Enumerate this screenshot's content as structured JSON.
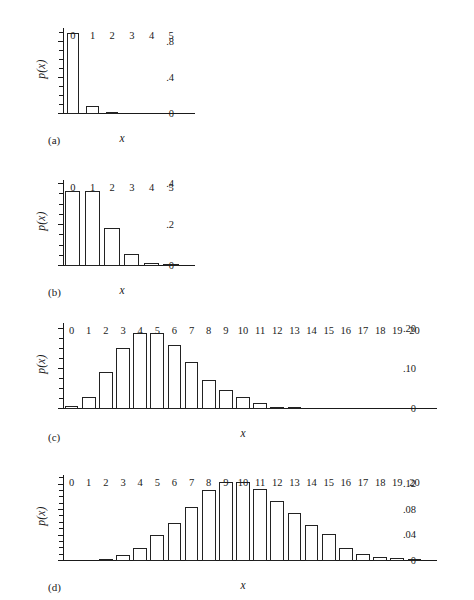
{
  "figure": {
    "background_color": "#ffffff",
    "ink_color": "#222222",
    "panels": [
      {
        "tag": "(a)",
        "tag_name": "panel-label-a",
        "xlabel": "x",
        "ylabel": "p(x)",
        "ytick_labels": [
          "0",
          ".4",
          ".8"
        ],
        "xtick_labels": [
          "0",
          "1",
          "2",
          "3",
          "4",
          "5"
        ]
      },
      {
        "tag": "(b)",
        "tag_name": "panel-label-b",
        "xlabel": "x",
        "ylabel": "p(x)",
        "ytick_labels": [
          "0",
          ".2",
          ".4"
        ],
        "xtick_labels": [
          "0",
          "1",
          "2",
          "3",
          "4",
          "5"
        ]
      },
      {
        "tag": "(c)",
        "tag_name": "panel-label-c",
        "xlabel": "x",
        "ylabel": "p(x)",
        "ytick_labels": [
          "0",
          ".10",
          ".20"
        ],
        "xtick_labels": [
          "0",
          "1",
          "2",
          "3",
          "4",
          "5",
          "6",
          "7",
          "8",
          "9",
          "10",
          "11",
          "12",
          "13",
          "14",
          "15",
          "16",
          "17",
          "18",
          "19",
          "20"
        ]
      },
      {
        "tag": "(d)",
        "tag_name": "panel-label-d",
        "xlabel": "x",
        "ylabel": "p(x)",
        "ytick_labels": [
          "0",
          ".04",
          ".08",
          ".12"
        ],
        "xtick_labels": [
          "0",
          "1",
          "2",
          "3",
          "4",
          "5",
          "6",
          "7",
          "8",
          "9",
          "10",
          "11",
          "12",
          "13",
          "14",
          "15",
          "16",
          "17",
          "18",
          "19",
          "20"
        ]
      }
    ]
  },
  "chart_data": [
    {
      "id": "a",
      "type": "bar",
      "title": "",
      "subtitle": "",
      "xlabel": "x",
      "ylabel": "p(x)",
      "categories": [
        0,
        1,
        2,
        3,
        4,
        5
      ],
      "values": [
        0.904,
        0.091,
        0.005,
        0.0,
        0.0,
        0.0
      ],
      "xlim": [
        -0.5,
        5.5
      ],
      "ylim": [
        0,
        0.96
      ],
      "ytick_values": [
        0,
        0.4,
        0.8
      ],
      "ytick_labels": [
        "0",
        ".4",
        ".8"
      ],
      "yminor_step": 0.1,
      "xtick_labels": [
        "0",
        "1",
        "2",
        "3",
        "4",
        "5"
      ],
      "grid": false,
      "legend": "none",
      "annotation": "(a)"
    },
    {
      "id": "b",
      "type": "bar",
      "title": "",
      "subtitle": "",
      "xlabel": "x",
      "ylabel": "p(x)",
      "categories": [
        0,
        1,
        2,
        3,
        4,
        5
      ],
      "values": [
        0.368,
        0.368,
        0.184,
        0.061,
        0.015,
        0.003
      ],
      "xlim": [
        -0.5,
        5.5
      ],
      "ylim": [
        0,
        0.42
      ],
      "ytick_values": [
        0,
        0.2,
        0.4
      ],
      "ytick_labels": [
        "0",
        ".2",
        ".4"
      ],
      "yminor_step": 0.05,
      "xtick_labels": [
        "0",
        "1",
        "2",
        "3",
        "4",
        "5"
      ],
      "grid": false,
      "legend": "none",
      "annotation": "(b)"
    },
    {
      "id": "c",
      "type": "bar",
      "title": "",
      "subtitle": "",
      "xlabel": "x",
      "ylabel": "p(x)",
      "categories": [
        0,
        1,
        2,
        3,
        4,
        5,
        6,
        7,
        8,
        9,
        10,
        11,
        12,
        13,
        14,
        15,
        16,
        17,
        18,
        19,
        20
      ],
      "values": [
        0.008,
        0.031,
        0.092,
        0.152,
        0.189,
        0.189,
        0.16,
        0.117,
        0.073,
        0.048,
        0.03,
        0.014,
        0.005,
        0.005,
        0.0,
        0.0,
        0.0,
        0.0,
        0.0,
        0.0,
        0.0
      ],
      "xlim": [
        -0.5,
        20.5
      ],
      "ylim": [
        0,
        0.215
      ],
      "ytick_values": [
        0,
        0.1,
        0.2
      ],
      "ytick_labels": [
        "0",
        ".10",
        ".20"
      ],
      "yminor_step": 0.025,
      "xtick_labels": [
        "0",
        "1",
        "2",
        "3",
        "4",
        "5",
        "6",
        "7",
        "8",
        "9",
        "10",
        "11",
        "12",
        "13",
        "14",
        "15",
        "16",
        "17",
        "18",
        "19",
        "20"
      ],
      "grid": false,
      "legend": "none",
      "annotation": "(c)"
    },
    {
      "id": "d",
      "type": "bar",
      "title": "",
      "subtitle": "",
      "xlabel": "x",
      "ylabel": "p(x)",
      "categories": [
        0,
        1,
        2,
        3,
        4,
        5,
        6,
        7,
        8,
        9,
        10,
        11,
        12,
        13,
        14,
        15,
        16,
        17,
        18,
        19,
        20
      ],
      "values": [
        0.0,
        0.0,
        0.003,
        0.01,
        0.021,
        0.041,
        0.06,
        0.085,
        0.111,
        0.124,
        0.124,
        0.113,
        0.094,
        0.075,
        0.057,
        0.043,
        0.02,
        0.011,
        0.007,
        0.004,
        0.003
      ],
      "xlim": [
        -0.5,
        20.5
      ],
      "ylim": [
        0,
        0.135
      ],
      "ytick_values": [
        0,
        0.04,
        0.08,
        0.12
      ],
      "ytick_labels": [
        "0",
        ".04",
        ".08",
        ".12"
      ],
      "yminor_step": 0.01,
      "xtick_labels": [
        "0",
        "1",
        "2",
        "3",
        "4",
        "5",
        "6",
        "7",
        "8",
        "9",
        "10",
        "11",
        "12",
        "13",
        "14",
        "15",
        "16",
        "17",
        "18",
        "19",
        "20"
      ],
      "grid": false,
      "legend": "none",
      "annotation": "(d)"
    }
  ]
}
